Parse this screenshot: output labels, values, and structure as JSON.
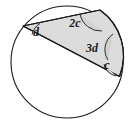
{
  "figure": {
    "kind": "circle-geometry-diagram",
    "background_color": "#ffffff",
    "stroke_color": "#1a1a1a",
    "shaded_fill_color": "#dcdcdc",
    "arc_fill_color": "#d2d2d2"
  },
  "circle": {
    "name": "outer-circle",
    "cx": 67,
    "cy": 62,
    "r": 56,
    "stroke_width": 1.1
  },
  "quadrilateral": {
    "name": "shaded-cyclic-quadrilateral",
    "points": "23,26 100,10 121,73 119,77",
    "vertices": [
      {
        "id": "left",
        "x": 23,
        "y": 26
      },
      {
        "id": "top",
        "x": 100,
        "y": 10
      },
      {
        "id": "right-upper",
        "x": 121,
        "y": 73
      },
      {
        "id": "bottom-right",
        "x": 119,
        "y": 77
      }
    ],
    "stroke_width": 1.2
  },
  "angle_labels": [
    {
      "id": "angle-d",
      "text": "d",
      "x": 36,
      "y": 36,
      "font_size": 12
    },
    {
      "id": "angle-2c",
      "text": "2c",
      "x": 73,
      "y": 27,
      "font_size": 12
    },
    {
      "id": "angle-3d",
      "text": "3d",
      "x": 89,
      "y": 51,
      "font_size": 12
    },
    {
      "id": "angle-c",
      "text": "c",
      "x": 106,
      "y": 68,
      "font_size": 12
    }
  ],
  "angle_arcs": [
    {
      "id": "arc-d",
      "at_vertex": "left"
    },
    {
      "id": "arc-2c",
      "at_vertex": "top"
    },
    {
      "id": "arc-3d",
      "at_vertex": "right-upper"
    },
    {
      "id": "arc-c",
      "at_vertex": "bottom-right"
    }
  ]
}
